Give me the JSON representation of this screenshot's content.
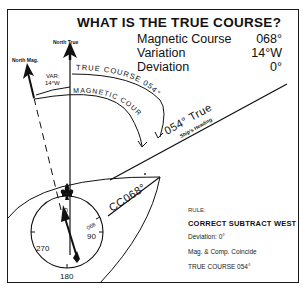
{
  "title": "WHAT IS THE TRUE COURSE?",
  "given": [
    {
      "label": "Magnetic Course",
      "value": "068°"
    },
    {
      "label": "Variation",
      "value": "14°W"
    },
    {
      "label": "Deviation",
      "value": "0°"
    }
  ],
  "labels": {
    "north_true": "North True",
    "north_mag": "North Mag.",
    "var_line1": "VAR:",
    "var_line2": "14°W",
    "true_course_arc": "TRUE COURSE 054°",
    "magnetic_course_arc": "MAGNETIC COURSE 068°",
    "heading_true": "054° True",
    "ships_heading": "Ship's Heading",
    "compass_course": "CC068°"
  },
  "compass": {
    "north": "0",
    "east": "90",
    "south": "180",
    "west": "270",
    "mark_068": "068"
  },
  "rule": {
    "heading": "RULE:",
    "main": "CORRECT SUBTRACT WEST",
    "lines": [
      "Deviation: 0°",
      "Mag. & Comp. Coincide",
      "TRUE COURSE 054°"
    ]
  },
  "colors": {
    "ink": "#111111",
    "background": "#ffffff"
  }
}
